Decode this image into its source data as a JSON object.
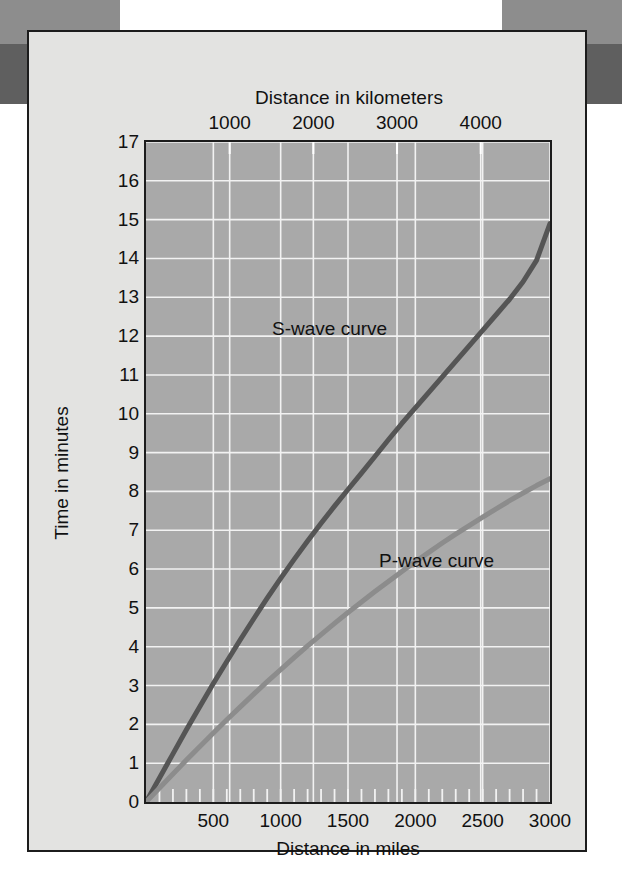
{
  "figure": {
    "background_color": "#e3e3e1",
    "plot_background_color": "#a9a9a9",
    "grid_color": "#f2f2f2",
    "frame_color": "#1c1c1c",
    "page_band_color": "#8d8d8d",
    "page_band_dark_color": "#5f5f5f"
  },
  "chart_data": {
    "type": "line",
    "title": "",
    "xlabel": "Distance in miles",
    "ylabel": "Time in minutes",
    "top_axis_label": "Distance in kilometers",
    "xlim": [
      0,
      3000
    ],
    "ylim": [
      0,
      17
    ],
    "top_xlim": [
      0,
      4828
    ],
    "grid": true,
    "legend_position": "inline-annotation",
    "x_ticks": [
      0,
      500,
      1000,
      1500,
      2000,
      2500,
      3000
    ],
    "x_tick_labels": [
      "",
      "500",
      "1000",
      "1500",
      "2000",
      "2500",
      "3000"
    ],
    "x_minor_tick_step": 100,
    "top_ticks": [
      1000,
      2000,
      3000,
      4000
    ],
    "top_tick_labels": [
      "1000",
      "2000",
      "3000",
      "4000"
    ],
    "y_ticks": [
      0,
      1,
      2,
      3,
      4,
      5,
      6,
      7,
      8,
      9,
      10,
      11,
      12,
      13,
      14,
      15,
      16,
      17
    ],
    "y_tick_labels": [
      "0",
      "1",
      "2",
      "3",
      "4",
      "5",
      "6",
      "7",
      "8",
      "9",
      "10",
      "11",
      "12",
      "13",
      "14",
      "15",
      "16",
      "17"
    ],
    "series": [
      {
        "name": "S-wave curve",
        "color": "#555555",
        "label_x_miles": 1430,
        "label_y_minutes": 12.3,
        "x": [
          0,
          100,
          200,
          300,
          400,
          500,
          600,
          700,
          800,
          900,
          1000,
          1100,
          1200,
          1300,
          1400,
          1500,
          1600,
          1700,
          1800,
          1900,
          2000,
          2100,
          2200,
          2300,
          2400,
          2500,
          2600,
          2700,
          2800,
          2900,
          3000
        ],
        "values": [
          0.0,
          0.62,
          1.24,
          1.86,
          2.46,
          3.05,
          3.62,
          4.18,
          4.72,
          5.25,
          5.76,
          6.25,
          6.72,
          7.18,
          7.62,
          8.05,
          8.47,
          8.9,
          9.33,
          9.75,
          10.15,
          10.55,
          10.95,
          11.35,
          11.75,
          12.15,
          12.55,
          12.95,
          13.4,
          13.95,
          14.9
        ]
      },
      {
        "name": "P-wave curve",
        "color": "#8c8c8c",
        "label_x_miles": 1760,
        "label_y_minutes": 5.1,
        "x": [
          0,
          100,
          200,
          300,
          400,
          500,
          600,
          700,
          800,
          900,
          1000,
          1100,
          1200,
          1300,
          1400,
          1500,
          1600,
          1700,
          1800,
          1900,
          2000,
          2100,
          2200,
          2300,
          2400,
          2500,
          2600,
          2700,
          2800,
          2900,
          3000
        ],
        "values": [
          0.0,
          0.36,
          0.72,
          1.08,
          1.43,
          1.78,
          2.12,
          2.45,
          2.78,
          3.1,
          3.41,
          3.72,
          4.02,
          4.31,
          4.6,
          4.88,
          5.15,
          5.42,
          5.68,
          5.94,
          6.19,
          6.43,
          6.67,
          6.9,
          7.12,
          7.34,
          7.55,
          7.76,
          7.96,
          8.15,
          8.33
        ]
      }
    ]
  }
}
